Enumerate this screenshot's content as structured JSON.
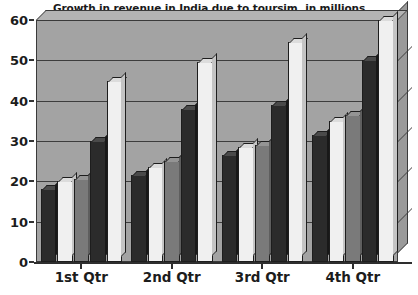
{
  "chart_data": {
    "type": "bar",
    "title": "Growth in revenue in India due to toursim, in millions",
    "xlabel": "",
    "ylabel": "",
    "ylim": [
      0,
      60
    ],
    "yticks": [
      0,
      10,
      20,
      30,
      40,
      50,
      60
    ],
    "grid": true,
    "legend": "none",
    "categories": [
      "1st Qtr",
      "2nd Qtr",
      "3rd Qtr",
      "4th Qtr"
    ],
    "series": [
      {
        "name": "Series 1",
        "color": "#2b2b2b",
        "values": [
          18,
          21.5,
          26.5,
          31.5
        ]
      },
      {
        "name": "Series 2",
        "color": "#f0f0f0",
        "values": [
          20,
          23.5,
          28.5,
          35
        ]
      },
      {
        "name": "Series 3",
        "color": "#7a7a7a",
        "values": [
          20.5,
          25,
          29,
          36.5
        ]
      },
      {
        "name": "Series 4",
        "color": "#2b2b2b",
        "values": [
          30,
          38,
          39,
          50
        ]
      },
      {
        "name": "Series 5",
        "color": "#f0f0f0",
        "values": [
          45,
          49.5,
          54.5,
          60
        ]
      }
    ],
    "plot_background": "#a3a3a3",
    "axis_color": "#2e2e2e"
  },
  "ytick_labels": [
    "60",
    "50",
    "40",
    "30",
    "20",
    "10",
    "0"
  ]
}
